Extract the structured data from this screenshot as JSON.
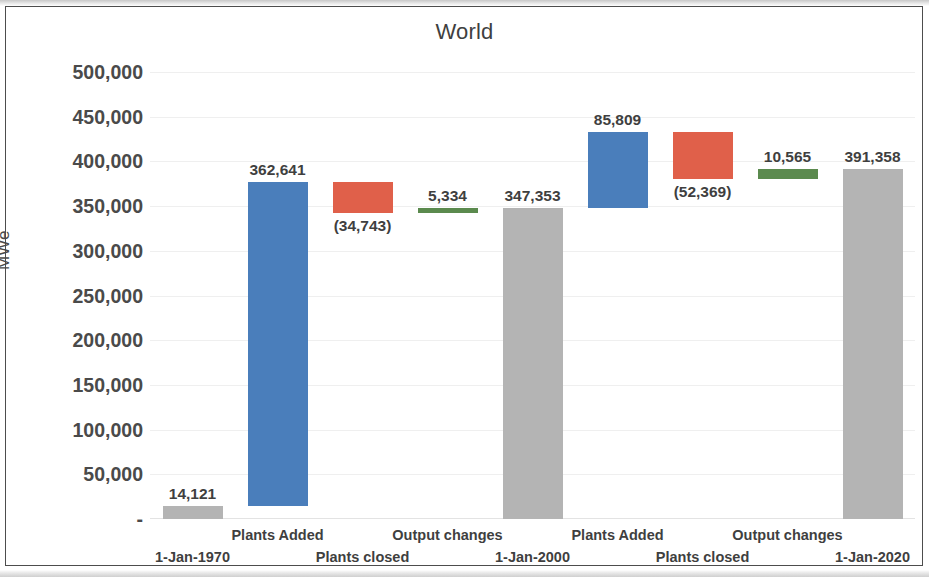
{
  "chart_data": {
    "type": "bar",
    "subtype": "waterfall",
    "title": "World",
    "xlabel": "",
    "ylabel": "MWe",
    "ylim": [
      0,
      500000
    ],
    "ytick_values": [
      500000,
      450000,
      400000,
      350000,
      300000,
      250000,
      200000,
      150000,
      100000,
      50000,
      0
    ],
    "ytick_labels": [
      "500,000",
      "450,000",
      "400,000",
      "350,000",
      "300,000",
      "250,000",
      "200,000",
      "150,000",
      "100,000",
      "50,000",
      "-"
    ],
    "grid": true,
    "legend": null,
    "categories": [
      "1-Jan-1970",
      "Plants Added",
      "Plants closed",
      "Output changes",
      "1-Jan-2000",
      "Plants Added",
      "Plants closed",
      "Output changes",
      "1-Jan-2020"
    ],
    "bars": [
      {
        "category": "1-Jan-1970",
        "kind": "total",
        "color": "#b4b4b4",
        "label": "14,121",
        "value": 14121,
        "base": 0,
        "top": 14121,
        "label_position": "above",
        "label_row": 1
      },
      {
        "category": "Plants Added",
        "kind": "increase",
        "color": "#4a7ebb",
        "label": "362,641",
        "value": 362641,
        "base": 14121,
        "top": 376762,
        "label_position": "above",
        "label_row": 0
      },
      {
        "category": "Plants closed",
        "kind": "decrease",
        "color": "#e0604a",
        "label": "(34,743)",
        "value": -34743,
        "base": 342019,
        "top": 376762,
        "label_position": "below",
        "label_row": 1
      },
      {
        "category": "Output changes",
        "kind": "increase",
        "color": "#5b8a4e",
        "label": "5,334",
        "value": 5334,
        "base": 342019,
        "top": 347353,
        "label_position": "above",
        "label_row": 0
      },
      {
        "category": "1-Jan-2000",
        "kind": "total",
        "color": "#b4b4b4",
        "label": "347,353",
        "value": 347353,
        "base": 0,
        "top": 347353,
        "label_position": "above",
        "label_row": 1
      },
      {
        "category": "Plants Added",
        "kind": "increase",
        "color": "#4a7ebb",
        "label": "85,809",
        "value": 85809,
        "base": 347353,
        "top": 433162,
        "label_position": "above",
        "label_row": 0
      },
      {
        "category": "Plants closed",
        "kind": "decrease",
        "color": "#e0604a",
        "label": "(52,369)",
        "value": -52369,
        "base": 380793,
        "top": 433162,
        "label_position": "below",
        "label_row": 1
      },
      {
        "category": "Output changes",
        "kind": "increase",
        "color": "#5b8a4e",
        "label": "10,565",
        "value": 10565,
        "base": 380793,
        "top": 391358,
        "label_position": "above",
        "label_row": 0
      },
      {
        "category": "1-Jan-2020",
        "kind": "total",
        "color": "#b4b4b4",
        "label": "391,358",
        "value": 391358,
        "base": 0,
        "top": 391358,
        "label_position": "above",
        "label_row": 1
      }
    ],
    "colors": {
      "increase_plants": "#4a7ebb",
      "decrease_plants": "#e0604a",
      "increase_output": "#5b8a4e",
      "total": "#b4b4b4",
      "text": "#3f3f3f",
      "gridline": "#efefef",
      "frame": "#4d4d4d"
    }
  }
}
